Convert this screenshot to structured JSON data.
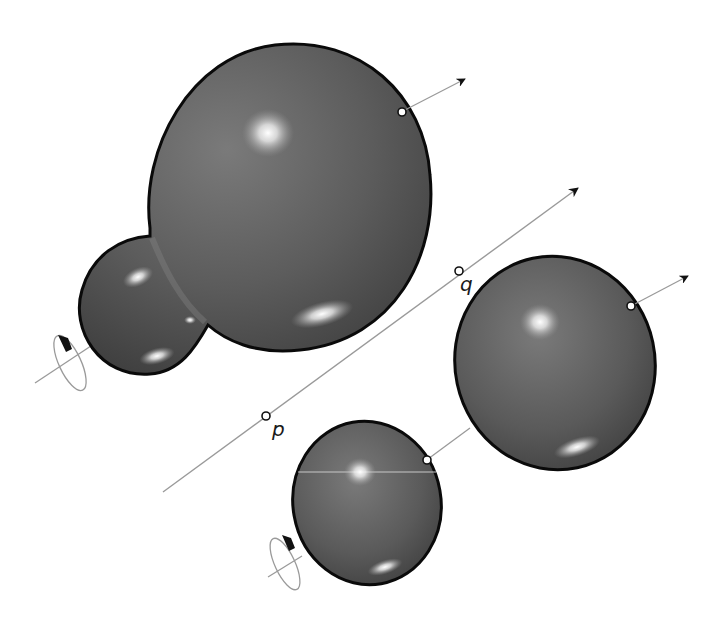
{
  "figure": {
    "colors": {
      "body_fill": "#5e5e5e",
      "body_outline": "#0a0a0a",
      "axis_line": "#9a9a9a",
      "highlight": "#ffffff",
      "arrowhead": "#111111",
      "background": "#ffffff"
    },
    "labels": {
      "p": "p",
      "q": "q"
    },
    "objects": [
      {
        "id": "blob",
        "kind": "fused-spheres",
        "parts": [
          "large-sphere",
          "small-sphere"
        ]
      },
      {
        "id": "sphere-right",
        "kind": "ellipsoid"
      },
      {
        "id": "sphere-bottom",
        "kind": "ellipsoid"
      }
    ],
    "annotations": {
      "central_axis": {
        "points": [
          "p",
          "q"
        ],
        "has_arrowhead": true
      },
      "rotation_markers": 2,
      "velocity_arrows": 2
    }
  }
}
